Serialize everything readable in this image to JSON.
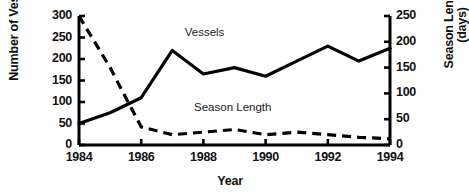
{
  "chart_data": {
    "type": "line",
    "title": "",
    "xlabel": "Year",
    "ylabel": "Number of Vessels",
    "y2label": "Season Length (days)",
    "x": [
      1984,
      1985,
      1986,
      1987,
      1988,
      1989,
      1990,
      1991,
      1992,
      1993,
      1994
    ],
    "xlim": [
      1984,
      1994
    ],
    "ylim": [
      0,
      300
    ],
    "y2lim": [
      0,
      250
    ],
    "grid": false,
    "legend_position": "inline-annotations",
    "xticks": [
      "1984",
      "1986",
      "1988",
      "1990",
      "1992",
      "1994"
    ],
    "xtick_values": [
      1984,
      1986,
      1988,
      1990,
      1992,
      1994
    ],
    "yticks": [
      "0",
      "50",
      "100",
      "150",
      "200",
      "250",
      "300"
    ],
    "ytick_values": [
      0,
      50,
      100,
      150,
      200,
      250,
      300
    ],
    "y2ticks": [
      "0",
      "50",
      "100",
      "150",
      "200",
      "250"
    ],
    "y2tick_values": [
      0,
      50,
      100,
      150,
      200,
      250
    ],
    "series": [
      {
        "name": "Vessels",
        "axis": "left",
        "style": "solid",
        "color": "#000000",
        "values": [
          50,
          75,
          110,
          220,
          165,
          180,
          160,
          195,
          230,
          195,
          225
        ]
      },
      {
        "name": "Season Length",
        "axis": "right",
        "style": "dashed",
        "color": "#000000",
        "values": [
          250,
          150,
          35,
          20,
          25,
          30,
          20,
          25,
          20,
          15,
          12
        ]
      }
    ],
    "annotations": [
      {
        "text": "Vessels",
        "x": 1988.3,
        "y": 260,
        "axis": "left"
      },
      {
        "text": "Season Length",
        "x": 1988.6,
        "y": 85,
        "axis": "left"
      }
    ]
  },
  "axes": {
    "left_title": "Number of Vessels",
    "right_title_line1": "Season Length",
    "right_title_line2": "(days)",
    "x_title": "Year"
  }
}
